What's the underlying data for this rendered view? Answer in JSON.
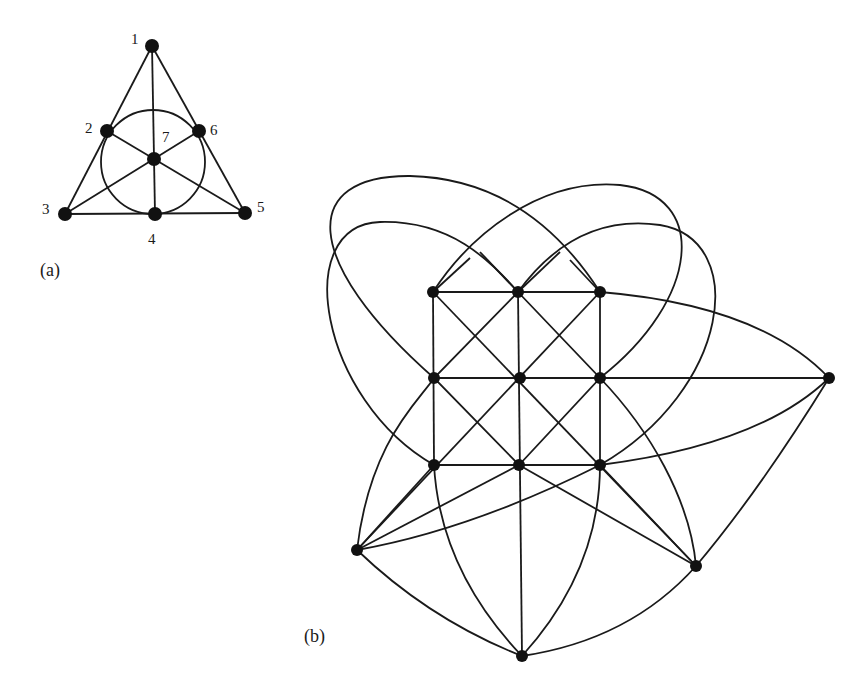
{
  "figure_a": {
    "caption": "(a)",
    "title": "Fano plane",
    "nodes": [
      {
        "id": "1",
        "label": "1",
        "x": 152,
        "y": 46,
        "lx": 131,
        "ly": 40
      },
      {
        "id": "2",
        "label": "2",
        "x": 107,
        "y": 131,
        "lx": 85,
        "ly": 129
      },
      {
        "id": "3",
        "label": "3",
        "x": 65,
        "y": 214,
        "lx": 42,
        "ly": 210
      },
      {
        "id": "4",
        "label": "4",
        "x": 155,
        "y": 214,
        "lx": 148,
        "ly": 240
      },
      {
        "id": "5",
        "label": "5",
        "x": 245,
        "y": 213,
        "lx": 257,
        "ly": 208
      },
      {
        "id": "6",
        "label": "6",
        "x": 199,
        "y": 131,
        "lx": 210,
        "ly": 131
      },
      {
        "id": "7",
        "label": "7",
        "x": 154,
        "y": 159,
        "lx": 162,
        "ly": 138
      }
    ],
    "lines": [
      [
        "1",
        "2",
        "3"
      ],
      [
        "1",
        "7",
        "4"
      ],
      [
        "1",
        "6",
        "5"
      ],
      [
        "3",
        "4",
        "5"
      ],
      [
        "3",
        "7",
        "6"
      ],
      [
        "2",
        "7",
        "5"
      ],
      [
        "2",
        "4",
        "6"
      ]
    ]
  },
  "figure_b": {
    "caption": "(b)",
    "nodes": [
      {
        "id": "g11",
        "x": 433,
        "y": 292
      },
      {
        "id": "g12",
        "x": 518,
        "y": 292
      },
      {
        "id": "g13",
        "x": 600,
        "y": 292
      },
      {
        "id": "g21",
        "x": 434,
        "y": 378
      },
      {
        "id": "g22",
        "x": 520,
        "y": 378
      },
      {
        "id": "g23",
        "x": 600,
        "y": 378
      },
      {
        "id": "g31",
        "x": 434,
        "y": 465
      },
      {
        "id": "g32",
        "x": 519,
        "y": 465
      },
      {
        "id": "g33",
        "x": 600,
        "y": 465
      },
      {
        "id": "R",
        "x": 829,
        "y": 378
      },
      {
        "id": "BL",
        "x": 357,
        "y": 550
      },
      {
        "id": "BR",
        "x": 696,
        "y": 566
      },
      {
        "id": "B",
        "x": 522,
        "y": 656
      }
    ]
  }
}
